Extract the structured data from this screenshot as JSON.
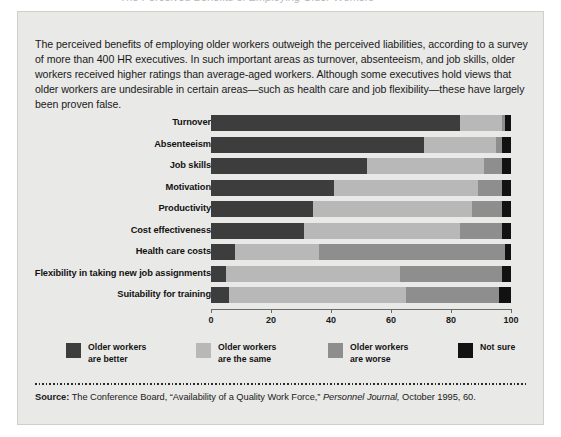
{
  "top_fragment": "The Perceived Benefits of Employing Older Workers",
  "intro": "The perceived benefits of employing older workers outweigh the perceived liabilities, according to a survey of more than 400 HR executives. In such important areas as turnover, absenteeism, and job skills, older workers received higher ratings than average-aged workers. Although some executives hold views that older workers are undesirable in certain areas—such as health care and job flexibility—these have largely  been proven false.",
  "legend": [
    {
      "line1": "Older workers",
      "line2": "are better",
      "color": "#3d3d3d",
      "name": "older-workers-are-better"
    },
    {
      "line1": "Older workers",
      "line2": "are the same",
      "color": "#b8b8b8",
      "name": "older-workers-are-the-same"
    },
    {
      "line1": "Older workers",
      "line2": "are worse",
      "color": "#8e8e8e",
      "name": "older-workers-are-worse"
    },
    {
      "line1": "Not sure",
      "line2": "",
      "color": "#121212",
      "name": "not-sure"
    }
  ],
  "source": {
    "label": "Source:",
    "rest_1": " The Conference Board, “Availability of a Quality Work Force,” ",
    "italic": "Personnel Journal,",
    "rest_2": " October 1995, 60."
  },
  "chart_data": {
    "type": "bar",
    "orientation": "horizontal",
    "stacked": true,
    "title": "",
    "xlabel": "",
    "ylabel": "",
    "xlim": [
      0,
      100
    ],
    "xticks": [
      0,
      20,
      40,
      60,
      80,
      100
    ],
    "grid": false,
    "legend_position": "bottom",
    "categories": [
      "Turnover",
      "Absenteeism",
      "Job skills",
      "Motivation",
      "Productivity",
      "Cost effectiveness",
      "Health care costs",
      "Flexibility in taking new job assignments",
      "Suitability for training"
    ],
    "series": [
      {
        "name": "Older workers are better",
        "color": "#3d3d3d",
        "values": [
          83,
          71,
          52,
          41,
          34,
          31,
          8,
          5,
          6
        ]
      },
      {
        "name": "Older workers are the same",
        "color": "#b8b8b8",
        "values": [
          14,
          24,
          39,
          48,
          53,
          52,
          28,
          58,
          59
        ]
      },
      {
        "name": "Older workers are worse",
        "color": "#8e8e8e",
        "values": [
          1,
          2,
          6,
          8,
          10,
          14,
          62,
          34,
          31
        ]
      },
      {
        "name": "Not sure",
        "color": "#121212",
        "values": [
          2,
          3,
          3,
          3,
          3,
          3,
          2,
          3,
          4
        ]
      }
    ]
  }
}
